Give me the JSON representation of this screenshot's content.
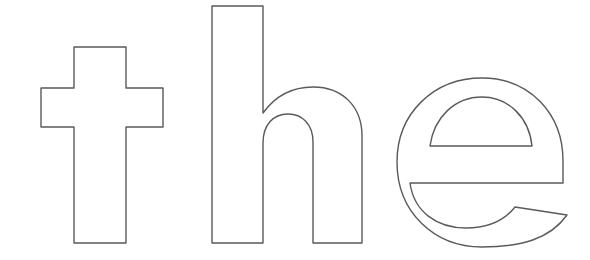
{
  "canvas": {
    "width": 590,
    "height": 260,
    "background_color": "#ffffff",
    "description": "Outlined coloring-page style rendering of the lowercase word 'the'"
  },
  "artwork": {
    "type": "text-outline",
    "word": "the",
    "style": "bold grotesque sans-serif, hollow outline",
    "stroke_color": "#5a5a5a",
    "fill_color": "#ffffff",
    "stroke_width": 1.4,
    "letters": [
      {
        "character": "t",
        "name": "letter-t",
        "shape": "cross",
        "bounds": {
          "x": 41,
          "y": 47,
          "width": 122,
          "height": 196
        },
        "stem": {
          "left": 74,
          "right": 126,
          "top": 47,
          "bottom": 243
        },
        "crossbar": {
          "left": 41,
          "right": 163,
          "top": 88,
          "bottom": 127
        }
      },
      {
        "character": "h",
        "name": "letter-h",
        "shape": "ascender-with-shoulder",
        "bounds": {
          "x": 212,
          "y": 6,
          "width": 150,
          "height": 237
        },
        "left_stem": {
          "left": 212,
          "right": 263,
          "top": 6,
          "bottom": 243
        },
        "right_stem": {
          "left": 313,
          "right": 362,
          "top": 130,
          "bottom": 243
        },
        "shoulder_top": 87
      },
      {
        "character": "e",
        "name": "letter-e",
        "shape": "bowl-with-crossbar",
        "bounds": {
          "x": 397,
          "y": 78,
          "width": 170,
          "height": 169
        },
        "crossbar_y": 183,
        "counter_bottom_y": 150,
        "terminal_tip": {
          "x": 567,
          "y": 215
        }
      }
    ]
  },
  "labels": {
    "alt_text": "the",
    "title": "the"
  }
}
